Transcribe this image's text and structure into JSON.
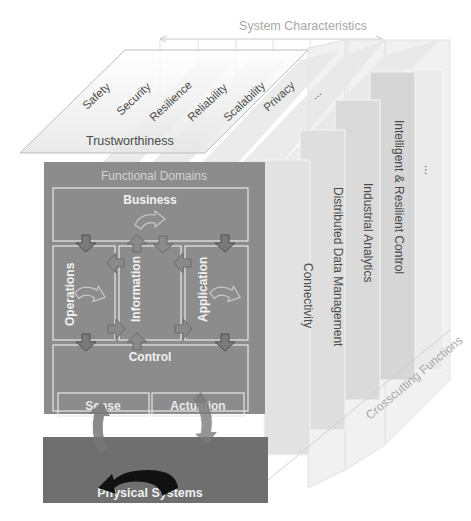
{
  "system_characteristics": {
    "title": "System Characteristics",
    "group_label": "Trustworthiness",
    "items": [
      "Safety",
      "Security",
      "Resilience",
      "Reliability",
      "Scalability",
      "Privacy",
      "..."
    ]
  },
  "crosscutting_functions": {
    "title": "Crosscutting Functions",
    "items": [
      "Connectivity",
      "Distributed Data Management",
      "Industrial Analytics",
      "Intelligent & Resilient Control",
      "..."
    ]
  },
  "functional_domains": {
    "title": "Functional Domains",
    "business": "Business",
    "operations": "Operations",
    "information": "Information",
    "application": "Application",
    "control": "Control",
    "sense": "Sense",
    "actuation": "Actuation"
  },
  "physical_systems": {
    "label": "Physical Systems"
  },
  "colors": {
    "domain_fill": "#8c8c8c",
    "physical_fill": "#6f6f6f",
    "panel_fill": "#dcdcdc",
    "label_light": "#a8a8a8",
    "label_dark": "#4a4a4a"
  }
}
